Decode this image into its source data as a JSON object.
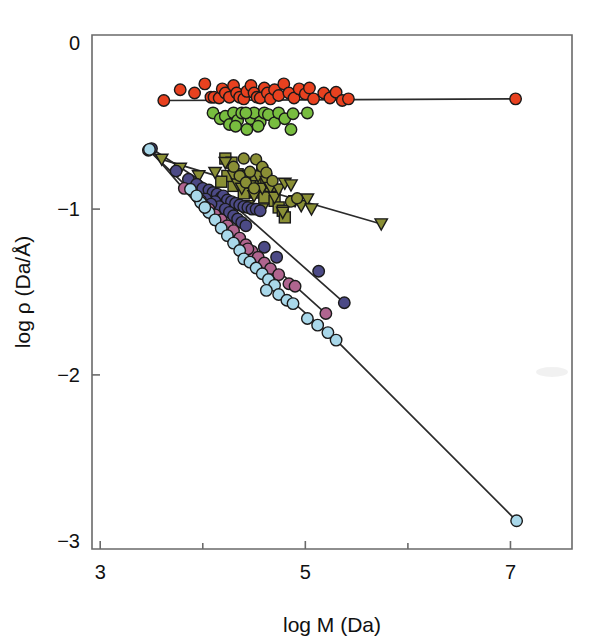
{
  "figure": {
    "background_color": "#ffffff",
    "frame_color": "#6a6a6a",
    "connector_color": "#2b2b2b",
    "marker_edge_color": "#1a1a1a"
  },
  "axes": {
    "x_title": "log M (Da)",
    "y_title": "log ρ (Da/Å)",
    "x_tick_labels": [
      "3",
      "5",
      "7"
    ],
    "y_tick_labels": [
      "0",
      "−1",
      "−2",
      "−3"
    ],
    "x_major_ticks": [
      3,
      5,
      7
    ],
    "x_minor_ticks": [
      4,
      6
    ],
    "y_major_ticks": [
      0,
      -1,
      -2,
      -3
    ],
    "xlim": [
      2.92,
      7.6
    ],
    "ylim": [
      -3.05,
      0.05
    ]
  },
  "chart_data": {
    "type": "scatter",
    "title": "",
    "xlabel": "log M (Da)",
    "ylabel": "log ρ (Da/Å)",
    "xlim": [
      2.92,
      7.6
    ],
    "ylim": [
      -3.05,
      0.05
    ],
    "grid": false,
    "legend_position": "none",
    "series": [
      {
        "name": "red-circles",
        "color": "#e8411f",
        "marker": "circle",
        "marker_size": 11.5,
        "connector": true,
        "connector_points": [
          [
            3.62,
            -0.345
          ],
          [
            7.05,
            -0.335
          ]
        ],
        "points": [
          [
            3.62,
            -0.345
          ],
          [
            3.78,
            -0.28
          ],
          [
            3.92,
            -0.3
          ],
          [
            4.02,
            -0.245
          ],
          [
            4.08,
            -0.325
          ],
          [
            4.11,
            -0.325
          ],
          [
            4.16,
            -0.33
          ],
          [
            4.19,
            -0.275
          ],
          [
            4.22,
            -0.3
          ],
          [
            4.26,
            -0.325
          ],
          [
            4.3,
            -0.255
          ],
          [
            4.33,
            -0.3
          ],
          [
            4.36,
            -0.325
          ],
          [
            4.4,
            -0.335
          ],
          [
            4.43,
            -0.29
          ],
          [
            4.47,
            -0.255
          ],
          [
            4.5,
            -0.3
          ],
          [
            4.53,
            -0.325
          ],
          [
            4.56,
            -0.33
          ],
          [
            4.6,
            -0.27
          ],
          [
            4.63,
            -0.3
          ],
          [
            4.66,
            -0.335
          ],
          [
            4.7,
            -0.28
          ],
          [
            4.74,
            -0.315
          ],
          [
            4.79,
            -0.245
          ],
          [
            4.84,
            -0.3
          ],
          [
            4.89,
            -0.33
          ],
          [
            4.94,
            -0.275
          ],
          [
            5.0,
            -0.305
          ],
          [
            5.04,
            -0.27
          ],
          [
            5.08,
            -0.335
          ],
          [
            5.18,
            -0.3
          ],
          [
            5.24,
            -0.33
          ],
          [
            5.3,
            -0.295
          ],
          [
            5.36,
            -0.345
          ],
          [
            5.42,
            -0.335
          ],
          [
            7.05,
            -0.335
          ]
        ]
      },
      {
        "name": "green-circles",
        "color": "#78bd3f",
        "marker": "circle",
        "marker_size": 11.5,
        "connector": true,
        "connector_points": [
          [
            4.1,
            -0.42
          ],
          [
            4.88,
            -0.425
          ],
          [
            5.02,
            -0.42
          ]
        ],
        "points": [
          [
            4.1,
            -0.42
          ],
          [
            4.17,
            -0.455
          ],
          [
            4.22,
            -0.44
          ],
          [
            4.26,
            -0.49
          ],
          [
            4.3,
            -0.42
          ],
          [
            4.34,
            -0.465
          ],
          [
            4.38,
            -0.42
          ],
          [
            4.43,
            -0.52
          ],
          [
            4.47,
            -0.455
          ],
          [
            4.5,
            -0.42
          ],
          [
            4.56,
            -0.475
          ],
          [
            4.6,
            -0.42
          ],
          [
            4.64,
            -0.43
          ],
          [
            4.7,
            -0.48
          ],
          [
            4.74,
            -0.42
          ],
          [
            4.8,
            -0.455
          ],
          [
            4.86,
            -0.52
          ],
          [
            4.88,
            -0.425
          ],
          [
            5.02,
            -0.42
          ],
          [
            4.32,
            -0.5
          ],
          [
            4.42,
            -0.42
          ],
          [
            4.54,
            -0.5
          ]
        ]
      },
      {
        "name": "olive-squares",
        "color": "#8a8f35",
        "marker": "square",
        "marker_size": 11,
        "connector": false,
        "points": [
          [
            4.22,
            -0.695
          ],
          [
            4.28,
            -0.72
          ],
          [
            4.34,
            -0.79
          ],
          [
            4.36,
            -0.84
          ],
          [
            4.3,
            -0.86
          ],
          [
            4.42,
            -0.8
          ],
          [
            4.46,
            -0.855
          ],
          [
            4.52,
            -0.82
          ],
          [
            4.58,
            -0.775
          ],
          [
            4.62,
            -0.82
          ],
          [
            4.66,
            -0.86
          ],
          [
            4.52,
            -0.9
          ],
          [
            4.6,
            -0.93
          ],
          [
            4.7,
            -0.95
          ],
          [
            4.74,
            -0.99
          ],
          [
            4.78,
            -1.01
          ],
          [
            4.8,
            -1.05
          ],
          [
            4.4,
            -0.905
          ],
          [
            4.24,
            -0.8
          ],
          [
            4.18,
            -0.835
          ]
        ]
      },
      {
        "name": "olive-triangles",
        "color": "#8a8f35",
        "marker": "triangle-down",
        "marker_size": 11.5,
        "connector": true,
        "connector_points": [
          [
            3.6,
            -0.7
          ],
          [
            4.46,
            -0.86
          ],
          [
            5.74,
            -1.09
          ]
        ],
        "points": [
          [
            3.6,
            -0.7
          ],
          [
            3.78,
            -0.755
          ],
          [
            3.96,
            -0.8
          ],
          [
            4.12,
            -0.78
          ],
          [
            4.22,
            -0.72
          ],
          [
            4.3,
            -0.8
          ],
          [
            4.34,
            -0.85
          ],
          [
            4.38,
            -0.875
          ],
          [
            4.46,
            -0.86
          ],
          [
            4.5,
            -0.92
          ],
          [
            4.54,
            -0.8
          ],
          [
            4.58,
            -0.875
          ],
          [
            4.62,
            -0.835
          ],
          [
            4.66,
            -0.87
          ],
          [
            4.7,
            -0.93
          ],
          [
            4.74,
            -0.88
          ],
          [
            4.8,
            -0.845
          ],
          [
            4.86,
            -0.855
          ],
          [
            4.9,
            -0.95
          ],
          [
            4.96,
            -0.98
          ],
          [
            5.02,
            -0.94
          ],
          [
            5.06,
            -1.0
          ],
          [
            4.44,
            -0.98
          ],
          [
            4.58,
            -1.0
          ],
          [
            4.78,
            -1.02
          ],
          [
            5.74,
            -1.09
          ]
        ]
      },
      {
        "name": "olive-circles",
        "color": "#8a8f35",
        "marker": "circle",
        "marker_size": 11,
        "connector": false,
        "points": [
          [
            4.4,
            -0.695
          ],
          [
            4.52,
            -0.7
          ],
          [
            4.58,
            -0.745
          ],
          [
            4.46,
            -0.775
          ],
          [
            4.62,
            -0.78
          ],
          [
            4.3,
            -0.745
          ],
          [
            4.36,
            -0.8
          ],
          [
            4.68,
            -0.83
          ],
          [
            4.86,
            -0.955
          ],
          [
            4.92,
            -0.935
          ],
          [
            4.42,
            -0.84
          ],
          [
            4.5,
            -0.875
          ]
        ]
      },
      {
        "name": "navy-circles",
        "color": "#4c4a86",
        "marker": "circle",
        "marker_size": 11.5,
        "connector": true,
        "connector_points": [
          [
            3.5,
            -0.635
          ],
          [
            4.2,
            -0.92
          ],
          [
            5.38,
            -1.565
          ]
        ],
        "points": [
          [
            3.5,
            -0.635
          ],
          [
            3.74,
            -0.77
          ],
          [
            3.86,
            -0.82
          ],
          [
            3.94,
            -0.85
          ],
          [
            4.0,
            -0.875
          ],
          [
            4.06,
            -0.885
          ],
          [
            4.1,
            -0.9
          ],
          [
            4.14,
            -0.91
          ],
          [
            4.18,
            -0.93
          ],
          [
            4.2,
            -0.92
          ],
          [
            4.24,
            -0.945
          ],
          [
            4.28,
            -0.955
          ],
          [
            4.32,
            -0.965
          ],
          [
            4.36,
            -0.975
          ],
          [
            4.4,
            -0.985
          ],
          [
            4.44,
            -0.99
          ],
          [
            4.48,
            -1.0
          ],
          [
            4.52,
            -1.0
          ],
          [
            4.56,
            -1.01
          ],
          [
            4.12,
            -0.955
          ],
          [
            4.16,
            -0.985
          ],
          [
            4.22,
            -1.0
          ],
          [
            4.26,
            -1.02
          ],
          [
            4.3,
            -1.04
          ],
          [
            4.34,
            -1.06
          ],
          [
            4.38,
            -1.08
          ],
          [
            4.42,
            -1.1
          ],
          [
            4.6,
            -1.23
          ],
          [
            4.72,
            -1.29
          ],
          [
            5.13,
            -1.375
          ],
          [
            5.38,
            -1.565
          ],
          [
            4.03,
            -0.94
          ],
          [
            4.08,
            -0.97
          ]
        ]
      },
      {
        "name": "mauve-circles",
        "color": "#b0658f",
        "marker": "circle",
        "marker_size": 11.5,
        "connector": true,
        "connector_points": [
          [
            3.47,
            -0.645
          ],
          [
            4.3,
            -1.13
          ],
          [
            5.2,
            -1.63
          ]
        ],
        "points": [
          [
            3.47,
            -0.645
          ],
          [
            3.82,
            -0.875
          ],
          [
            3.98,
            -0.95
          ],
          [
            4.06,
            -1.0
          ],
          [
            4.12,
            -1.035
          ],
          [
            4.18,
            -1.065
          ],
          [
            4.24,
            -1.1
          ],
          [
            4.3,
            -1.13
          ],
          [
            4.36,
            -1.175
          ],
          [
            4.42,
            -1.215
          ],
          [
            4.48,
            -1.255
          ],
          [
            4.54,
            -1.29
          ],
          [
            4.6,
            -1.325
          ],
          [
            4.66,
            -1.36
          ],
          [
            4.74,
            -1.395
          ],
          [
            4.84,
            -1.45
          ],
          [
            4.9,
            -1.465
          ],
          [
            5.2,
            -1.63
          ],
          [
            4.02,
            -0.985
          ],
          [
            4.44,
            -1.24
          ]
        ]
      },
      {
        "name": "lightblue-circles",
        "color": "#a9d8ea",
        "marker": "circle",
        "marker_size": 11.5,
        "connector": true,
        "connector_points": [
          [
            3.48,
            -0.64
          ],
          [
            4.4,
            -1.3
          ],
          [
            5.3,
            -1.79
          ],
          [
            7.06,
            -2.88
          ]
        ],
        "points": [
          [
            3.48,
            -0.64
          ],
          [
            3.88,
            -0.88
          ],
          [
            3.98,
            -0.96
          ],
          [
            4.06,
            -1.02
          ],
          [
            4.12,
            -1.065
          ],
          [
            4.18,
            -1.115
          ],
          [
            4.24,
            -1.16
          ],
          [
            4.3,
            -1.205
          ],
          [
            4.36,
            -1.25
          ],
          [
            4.4,
            -1.3
          ],
          [
            4.46,
            -1.32
          ],
          [
            4.52,
            -1.355
          ],
          [
            4.58,
            -1.39
          ],
          [
            4.64,
            -1.425
          ],
          [
            4.7,
            -1.46
          ],
          [
            4.62,
            -1.49
          ],
          [
            4.74,
            -1.515
          ],
          [
            4.82,
            -1.55
          ],
          [
            4.88,
            -1.57
          ],
          [
            5.02,
            -1.66
          ],
          [
            5.12,
            -1.7
          ],
          [
            5.22,
            -1.745
          ],
          [
            5.3,
            -1.79
          ],
          [
            3.94,
            -0.92
          ],
          [
            4.02,
            -0.99
          ],
          [
            7.06,
            -2.88
          ]
        ]
      }
    ]
  }
}
